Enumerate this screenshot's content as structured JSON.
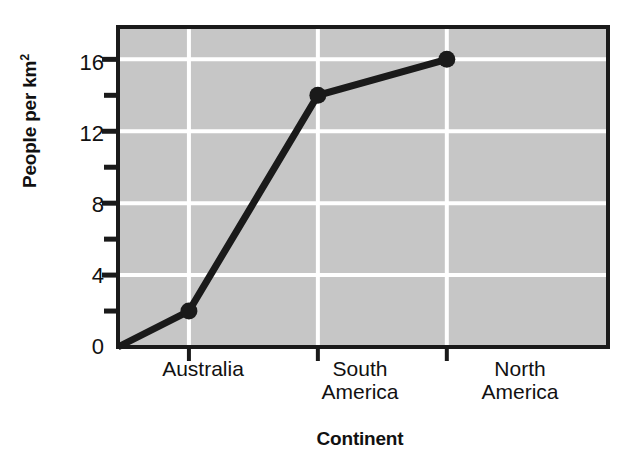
{
  "chart_data": {
    "type": "line",
    "title": "",
    "xlabel": "Continent",
    "ylabel": "People per km²",
    "categories": [
      "Australia",
      "South America",
      "North America"
    ],
    "values": [
      2,
      14,
      16
    ],
    "ylim": [
      0,
      17.8
    ],
    "yticks_major": [
      0,
      4,
      8,
      12,
      16
    ],
    "yticks_minor": [
      2,
      6,
      10,
      14
    ],
    "grid": "horizontal-and-vertical-white",
    "legend": "none",
    "series": [
      {
        "name": "People per km²",
        "values": [
          2,
          14,
          16
        ]
      }
    ],
    "origin_anchor": 0,
    "colors": {
      "plot_background": "#c6c6c6",
      "gridline": "#ffffff",
      "line": "#1a1a1a",
      "marker": "#1a1a1a",
      "axis": "#1a1a1a",
      "text": "#111111",
      "page_background": "#ffffff"
    }
  },
  "axes": {
    "y_title": "People per km",
    "y_title_superscript": "2",
    "x_title": "Continent",
    "y_tick_labels": [
      "16",
      "12",
      "8",
      "4",
      "0"
    ],
    "x_tick_labels": [
      {
        "line1": "Australia",
        "line2": ""
      },
      {
        "line1": "South",
        "line2": "America"
      },
      {
        "line1": "North",
        "line2": "America"
      }
    ]
  }
}
